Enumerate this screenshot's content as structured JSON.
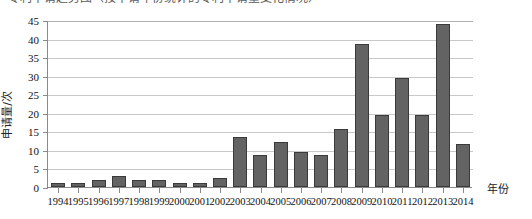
{
  "caption": {
    "text": "专利申请趋势图（按申请年份统计的专利申请量变化情况）"
  },
  "chart_data": {
    "type": "bar",
    "title": "",
    "xlabel": "年份",
    "ylabel": "申请量/次",
    "categories": [
      "1994",
      "1995",
      "1996",
      "1997",
      "1998",
      "1999",
      "2000",
      "2001",
      "2002",
      "2003",
      "2004",
      "2005",
      "2006",
      "2007",
      "2008",
      "2009",
      "2010",
      "2011",
      "2012",
      "2013",
      "2014"
    ],
    "values": [
      1,
      1,
      2,
      3,
      1.8,
      1.8,
      1,
      1,
      2.3,
      13.5,
      8.5,
      12,
      9.5,
      8.7,
      15.5,
      38.5,
      19.5,
      29.5,
      19.5,
      44,
      11.5
    ],
    "ylim": [
      0,
      45
    ],
    "yticks": [
      0,
      5,
      10,
      15,
      20,
      25,
      30,
      35,
      40,
      45
    ],
    "grid": true,
    "legend": "none",
    "bar_color": "#636363",
    "bar_edge_color": "#3a3a3a",
    "grid_color": "#c8c8c8",
    "axis_color": "#8a8a8a"
  }
}
